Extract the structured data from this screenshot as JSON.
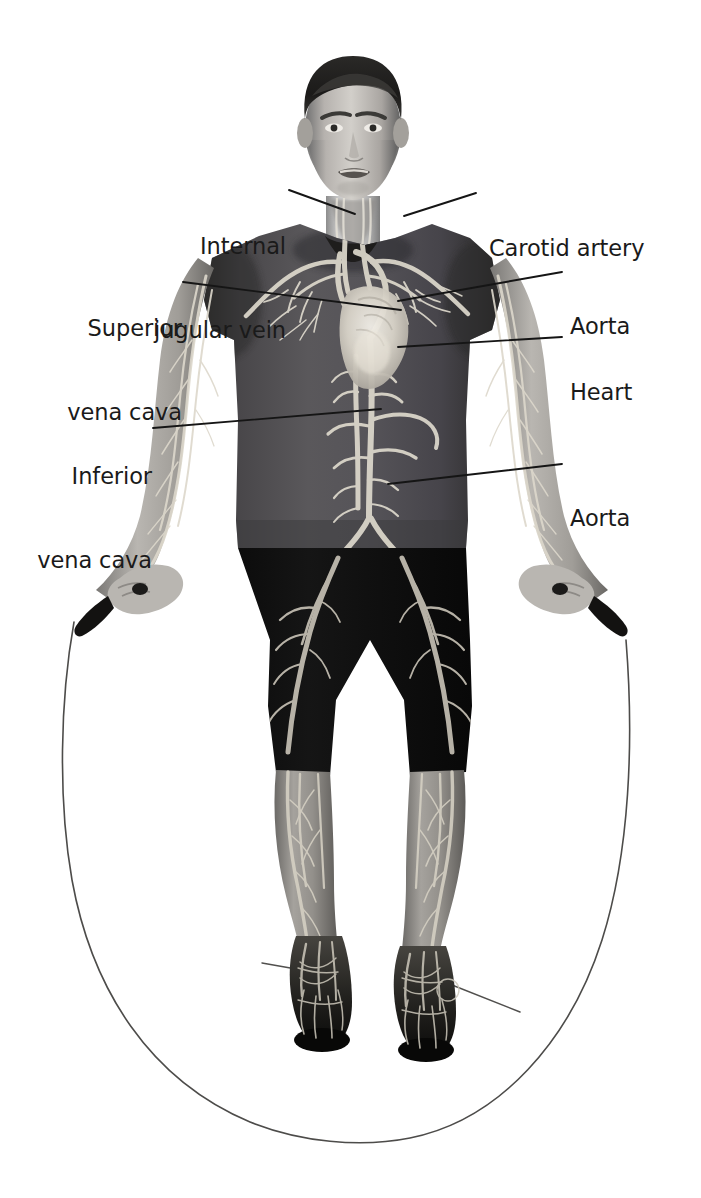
{
  "figure": {
    "image_style": "grayscale photograph with vascular anatomy overlay",
    "background_color": "#ffffff",
    "label_color": "#1a1a1a",
    "leader_line_color": "#151515"
  },
  "labels": [
    {
      "id": "internal-jugular-vein",
      "text_lines": [
        "Internal",
        "jugular vein"
      ],
      "line1": "Internal",
      "line2": "jugular vein",
      "side": "left",
      "text_x": 276,
      "text_y": 176,
      "leader": {
        "x1": 289,
        "y1": 190,
        "x2": 355,
        "y2": 214
      }
    },
    {
      "id": "carotid-artery",
      "text_lines": [
        "Carotid artery"
      ],
      "line1": "Carotid artery",
      "line2": "",
      "side": "right",
      "text_x": 489,
      "text_y": 178,
      "leader": {
        "x1": 476,
        "y1": 193,
        "x2": 404,
        "y2": 216
      }
    },
    {
      "id": "superior-vena-cava",
      "text_lines": [
        "Superior",
        "vena cava"
      ],
      "line1": "Superior",
      "line2": "vena cava",
      "side": "left",
      "text_x": 186,
      "text_y": 258,
      "leader": {
        "x1": 183,
        "y1": 282,
        "x2": 401,
        "y2": 310
      }
    },
    {
      "id": "aorta-upper",
      "text_lines": [
        "Aorta"
      ],
      "line1": "Aorta",
      "line2": "",
      "side": "right",
      "text_x": 570,
      "text_y": 256,
      "leader": {
        "x1": 562,
        "y1": 272,
        "x2": 398,
        "y2": 301
      }
    },
    {
      "id": "heart",
      "text_lines": [
        "Heart"
      ],
      "line1": "Heart",
      "line2": "",
      "side": "right",
      "text_x": 570,
      "text_y": 322,
      "leader": {
        "x1": 562,
        "y1": 337,
        "x2": 398,
        "y2": 347
      }
    },
    {
      "id": "inferior-vena-cava",
      "text_lines": [
        "Inferior",
        "vena cava"
      ],
      "line1": "Inferior",
      "line2": "vena cava",
      "side": "left",
      "text_x": 186,
      "text_y": 406,
      "leader": {
        "x1": 153,
        "y1": 428,
        "x2": 381,
        "y2": 409
      }
    },
    {
      "id": "aorta-lower",
      "text_lines": [
        "Aorta"
      ],
      "line1": "Aorta",
      "line2": "",
      "side": "right",
      "text_x": 570,
      "text_y": 448,
      "leader": {
        "x1": 562,
        "y1": 464,
        "x2": 388,
        "y2": 484
      }
    }
  ],
  "anatomy_features": [
    "internal jugular vein",
    "carotid artery",
    "superior vena cava",
    "aortic arch",
    "heart",
    "inferior vena cava",
    "abdominal aorta",
    "iliac arteries",
    "femoral arteries",
    "arm vasculature",
    "foot vasculature"
  ],
  "scene_objects": [
    "jump rope",
    "rope handle left",
    "rope handle right",
    "t-shirt",
    "shorts",
    "sneakers"
  ]
}
